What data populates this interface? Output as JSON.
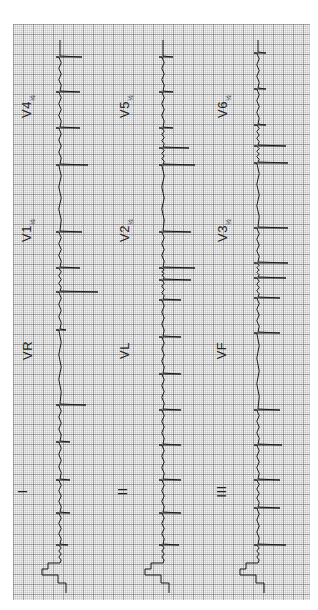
{
  "ecg": {
    "layout": "3 columns x 4 rows, rotated 90 degrees counter-clockwise",
    "colors": {
      "grid_bg": "#f4f4f4",
      "grid_line": "#888888",
      "trace": "#1a1a1a"
    },
    "labels": [
      {
        "id": "I",
        "text": "I",
        "col": 0,
        "x": 20,
        "y": 484
      },
      {
        "id": "II",
        "text": "II",
        "col": 1,
        "x": 118,
        "y": 484
      },
      {
        "id": "III",
        "text": "III",
        "col": 2,
        "x": 215,
        "y": 484
      },
      {
        "id": "VR",
        "text": "VR",
        "col": 0,
        "x": 18,
        "y": 343
      },
      {
        "id": "VL",
        "text": "VL",
        "col": 1,
        "x": 116,
        "y": 343
      },
      {
        "id": "VF",
        "text": "VF",
        "col": 2,
        "x": 213,
        "y": 343
      },
      {
        "id": "V1",
        "text": "V1",
        "sub": "½",
        "col": 0,
        "x": 16,
        "y": 222
      },
      {
        "id": "V2",
        "text": "V2",
        "sub": "½",
        "col": 1,
        "x": 114,
        "y": 222
      },
      {
        "id": "V3",
        "text": "V3",
        "sub": "½",
        "col": 2,
        "x": 212,
        "y": 222
      },
      {
        "id": "V4",
        "text": "V4",
        "sub": "½",
        "col": 0,
        "x": 16,
        "y": 98
      },
      {
        "id": "V5",
        "text": "V5",
        "sub": "½",
        "col": 1,
        "x": 114,
        "y": 98
      },
      {
        "id": "V6",
        "text": "V6",
        "sub": "½",
        "col": 2,
        "x": 212,
        "y": 98
      }
    ],
    "columns": [
      {
        "baseline_x": 60,
        "beats_y": [
          57,
          92,
          128,
          165,
          232,
          268,
          292,
          330,
          405,
          442,
          480,
          513,
          545
        ],
        "spike_len": [
          22,
          20,
          20,
          28,
          22,
          20,
          38,
          6,
          26,
          10,
          10,
          10,
          8
        ]
      },
      {
        "baseline_x": 163,
        "beats_y": [
          57,
          92,
          128,
          148,
          165,
          232,
          268,
          280,
          300,
          337,
          374,
          410,
          445,
          480,
          513,
          545
        ],
        "spike_len": [
          10,
          10,
          10,
          26,
          32,
          28,
          32,
          28,
          18,
          18,
          18,
          18,
          18,
          18,
          18,
          16
        ]
      },
      {
        "baseline_x": 258,
        "beats_y": [
          53,
          89,
          125,
          146,
          163,
          228,
          263,
          278,
          298,
          333,
          410,
          445,
          480,
          508,
          545
        ],
        "spike_len": [
          8,
          8,
          8,
          28,
          30,
          30,
          30,
          28,
          22,
          22,
          22,
          24,
          22,
          22,
          28
        ]
      }
    ]
  }
}
